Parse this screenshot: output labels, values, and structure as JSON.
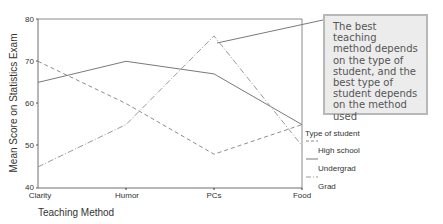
{
  "chart_data": {
    "type": "line",
    "title": "",
    "xlabel": "Teaching Method",
    "ylabel": "Mean Score on Statistics Exam",
    "categories": [
      "Clarity",
      "Humor",
      "PCs",
      "Food"
    ],
    "ylim": [
      40,
      80
    ],
    "yticks": [
      40,
      50,
      60,
      70,
      80
    ],
    "grid": false,
    "legend_position": "right",
    "legend_title": "Type of student",
    "series": [
      {
        "name": "High school",
        "style": "dashed",
        "values": [
          70,
          60,
          48,
          55
        ]
      },
      {
        "name": "Undergrad",
        "style": "solid",
        "values": [
          65,
          70,
          67,
          55
        ]
      },
      {
        "name": "Grad",
        "style": "dash-dot",
        "values": [
          45,
          55,
          76,
          50
        ]
      }
    ],
    "annotations": [
      {
        "text": "The best teaching method depends on the type of student, and the best type of student depends on the method used",
        "points_to": {
          "category": "PCs",
          "series": "Grad"
        }
      }
    ]
  },
  "axes": {
    "y_title": "Mean Score on Statistics Exam",
    "x_title": "Teaching Method",
    "y_ticks": [
      "40",
      "50",
      "60",
      "70",
      "80"
    ],
    "x_ticks": [
      "Clarity",
      "Humor",
      "PCs",
      "Food"
    ]
  },
  "legend": {
    "title": "Type of student",
    "items": [
      "High school",
      "Undergrad",
      "Grad"
    ]
  },
  "annotation": {
    "lines": [
      "The best teaching",
      "method depends",
      "on the type of",
      "student, and the",
      "best type of",
      "student depends",
      "on the method",
      "used"
    ]
  },
  "colors": {
    "line": "#7a7a7a",
    "axis": "#6e6e6e",
    "annotation_fill": "#ececec",
    "annotation_border": "#b8b8b8"
  }
}
